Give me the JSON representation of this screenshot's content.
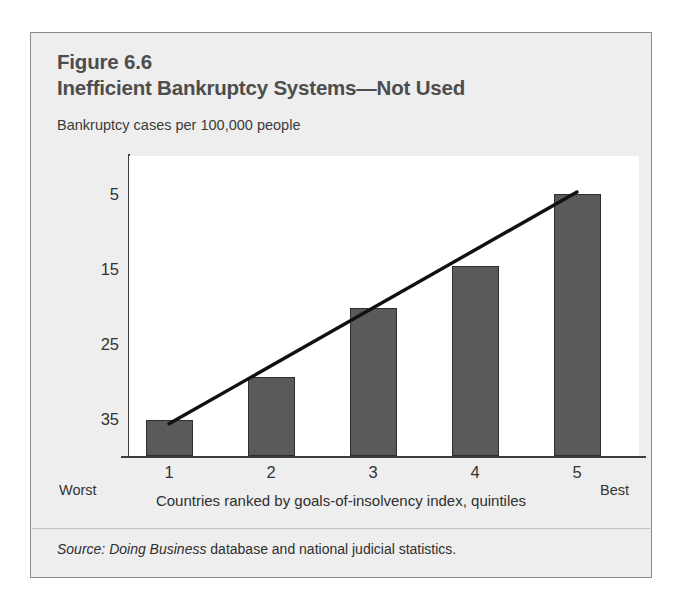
{
  "figure": {
    "number": "Figure 6.6",
    "title": "Inefficient Bankruptcy Systems—Not Used",
    "subtitle": "Bankruptcy cases per 100,000 people",
    "source_prefix": "Source: Doing Business",
    "source_rest": " database and national judicial statistics."
  },
  "chart_data": {
    "type": "bar",
    "title": "Inefficient Bankruptcy Systems—Not Used",
    "subtitle": "Bankruptcy cases per 100,000 people",
    "categories": [
      "1",
      "2",
      "3",
      "4",
      "5"
    ],
    "values": [
      4.8,
      10.5,
      19.7,
      25.4,
      35.0
    ],
    "series": [
      {
        "name": "Bankruptcy cases per 100,000 people",
        "type": "bar",
        "values": [
          4.8,
          10.5,
          19.7,
          25.4,
          35.0
        ]
      },
      {
        "name": "Trend line",
        "type": "line",
        "x": [
          "1",
          "5"
        ],
        "values": [
          4.3,
          35.2
        ]
      }
    ],
    "xlabel": "Countries ranked by goals-of-insolvency index, quintiles",
    "ylabel": "",
    "ylim": [
      0,
      40
    ],
    "yticks": [
      5,
      15,
      25,
      35
    ],
    "ytick_labels": [
      "5",
      "15",
      "25",
      "35"
    ],
    "xtick_labels": [
      "1",
      "2",
      "3",
      "4",
      "5"
    ],
    "x_axis_end_labels": {
      "left": "Worst",
      "right": "Best"
    },
    "grid": false,
    "legend": "none",
    "colors": {
      "bar_fill": "#5a5a5a",
      "bar_border": "#2e2e2e",
      "trend_line": "#111111",
      "plot_background": "#ffffff",
      "panel_background": "#eeeeee",
      "panel_border": "#8b8b8b",
      "text": "#333333",
      "title_text": "#4d4d4d"
    }
  }
}
